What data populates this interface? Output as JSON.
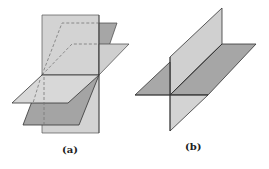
{
  "figures": [
    {
      "id": "a",
      "caption": "(a)",
      "description": "Three planes intersecting in a common line: a vertical plane, and two oblique planes sharing one edge line"
    },
    {
      "id": "b",
      "caption": "(b)",
      "description": "Two perpendicular planes intersecting along a line"
    }
  ],
  "colors": {
    "light_plane": "#d6d6d6",
    "mid_plane": "#c4c4c4",
    "dark_plane": "#a4a4a4",
    "edge": "#333333",
    "dashed": "#777777",
    "background": "#ffffff"
  }
}
